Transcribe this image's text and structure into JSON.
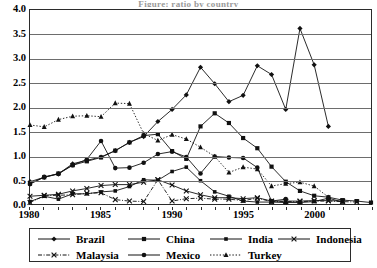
{
  "title_sliver": "Figure: ratio by country",
  "axes": {
    "y_ticks": [
      "4.0",
      "3.5",
      "3.0",
      "2.5",
      "2.0",
      "1.5",
      "1.0",
      "0.5",
      "0.0"
    ],
    "x_ticks": [
      "1980",
      "1985",
      "1990",
      "1995",
      "2000"
    ],
    "ylim": [
      0.0,
      4.0
    ],
    "xlim": [
      1980,
      2004
    ],
    "grid": "horizontal"
  },
  "legend": {
    "rows": [
      [
        {
          "label": "Brazil",
          "marker": "diamond",
          "line": "solid"
        },
        {
          "label": "China",
          "marker": "square",
          "line": "solid"
        },
        {
          "label": "India",
          "marker": "square-small",
          "line": "solid"
        },
        {
          "label": "Indonesia",
          "marker": "x-cross",
          "line": "solid"
        }
      ],
      [
        {
          "label": "Malaysia",
          "marker": "x-cross",
          "line": "dash-dot"
        },
        {
          "label": "Mexico",
          "marker": "circle",
          "line": "solid"
        },
        {
          "label": "Turkey",
          "marker": "triangle",
          "line": "dotted"
        }
      ]
    ]
  },
  "chart_data": {
    "type": "line",
    "title": "",
    "xlabel": "",
    "ylabel": "",
    "xlim": [
      1980,
      2004
    ],
    "ylim": [
      0.0,
      4.0
    ],
    "grid": true,
    "legend_position": "bottom",
    "series": [
      {
        "name": "Brazil",
        "marker": "diamond",
        "line": "solid",
        "x": [
          1980,
          1981,
          1982,
          1983,
          1984,
          1985,
          1986,
          1987,
          1988,
          1989,
          1990,
          1991,
          1992,
          1993,
          1994,
          1995,
          1996,
          1997,
          1998,
          1999,
          2000,
          2001
        ],
        "y": [
          0.46,
          0.55,
          0.62,
          0.83,
          0.9,
          0.97,
          1.1,
          1.27,
          1.39,
          1.7,
          1.95,
          2.25,
          2.82,
          2.48,
          2.11,
          2.24,
          2.85,
          2.67,
          1.95,
          3.62,
          2.87,
          1.6
        ]
      },
      {
        "name": "China",
        "marker": "square",
        "line": "solid",
        "x": [
          1980,
          1981,
          1982,
          1983,
          1984,
          1985,
          1986,
          1987,
          1988,
          1989,
          1990,
          1991,
          1992,
          1993,
          1994,
          1995,
          1996,
          1997,
          1998,
          1999,
          2000,
          2001,
          2002,
          2003,
          2004
        ],
        "y": [
          0.42,
          0.55,
          0.63,
          0.8,
          0.88,
          0.96,
          1.1,
          1.27,
          1.41,
          1.44,
          1.09,
          0.93,
          1.6,
          1.87,
          1.67,
          1.36,
          1.15,
          0.77,
          0.46,
          0.27,
          0.17,
          0.14,
          0.08,
          0.06,
          0.03
        ]
      },
      {
        "name": "India",
        "marker": "square-small",
        "line": "solid",
        "x": [
          1980,
          1981,
          1982,
          1983,
          1984,
          1985,
          1986,
          1987,
          1988,
          1989,
          1990,
          1991,
          1992,
          1993,
          1994,
          1995,
          1996,
          1997,
          1998,
          1999,
          2000,
          2001,
          2002
        ],
        "y": [
          0.05,
          0.16,
          0.1,
          0.21,
          0.21,
          0.25,
          0.27,
          0.36,
          0.5,
          0.49,
          0.67,
          0.76,
          0.48,
          0.25,
          0.16,
          0.06,
          0.04,
          0.04,
          0.03,
          0.03,
          0.05,
          0.12,
          0.04
        ]
      },
      {
        "name": "Indonesia",
        "marker": "x-cross",
        "line": "solid",
        "x": [
          1980,
          1981,
          1982,
          1983,
          1984,
          1985,
          1986,
          1987,
          1988,
          1989,
          1990,
          1991,
          1992,
          1993,
          1994,
          1995,
          1996,
          1997,
          1998,
          1999,
          2000,
          2001,
          2002
        ],
        "y": [
          0.16,
          0.18,
          0.2,
          0.27,
          0.32,
          0.38,
          0.4,
          0.4,
          0.45,
          0.5,
          0.39,
          0.27,
          0.19,
          0.13,
          0.13,
          0.11,
          0.13,
          0.06,
          0.06,
          0.06,
          0.07,
          0.07,
          0.06
        ]
      },
      {
        "name": "Malaysia",
        "marker": "x-cross",
        "line": "dash-dot",
        "x": [
          1980,
          1981,
          1982,
          1983,
          1984,
          1985,
          1986,
          1987,
          1988,
          1989,
          1990,
          1991,
          1992,
          1993,
          1994,
          1995,
          1996,
          1997,
          1998,
          1999,
          2000,
          2001,
          2002,
          2003
        ],
        "y": [
          0.03,
          0.17,
          0.18,
          0.19,
          0.22,
          0.23,
          0.09,
          0.06,
          0.05,
          0.5,
          0.06,
          0.11,
          0.12,
          0.1,
          0.1,
          0.07,
          0.12,
          0.05,
          0.05,
          0.05,
          0.06,
          0.06,
          0.05,
          0.04
        ]
      },
      {
        "name": "Mexico",
        "marker": "circle",
        "line": "solid",
        "x": [
          1980,
          1981,
          1982,
          1983,
          1984,
          1985,
          1986,
          1987,
          1988,
          1989,
          1990,
          1991,
          1992,
          1993,
          1994,
          1995,
          1996,
          1997,
          1998
        ],
        "y": [
          0.41,
          0.56,
          0.62,
          0.8,
          0.92,
          1.3,
          0.74,
          0.75,
          0.85,
          1.03,
          1.08,
          0.97,
          0.63,
          0.98,
          0.96,
          0.95,
          0.75,
          0.06,
          0.1
        ]
      },
      {
        "name": "Turkey",
        "marker": "triangle",
        "line": "dotted",
        "x": [
          1980,
          1981,
          1982,
          1983,
          1984,
          1985,
          1986,
          1987,
          1988,
          1989,
          1990,
          1991,
          1992,
          1993,
          1994,
          1995,
          1996,
          1997,
          1998,
          1999,
          2000,
          2001
        ],
        "y": [
          1.63,
          1.59,
          1.74,
          1.81,
          1.82,
          1.8,
          2.08,
          2.07,
          1.45,
          1.31,
          1.43,
          1.34,
          1.17,
          0.98,
          0.65,
          0.76,
          0.72,
          0.37,
          0.42,
          0.45,
          0.37,
          0.14
        ]
      }
    ]
  }
}
